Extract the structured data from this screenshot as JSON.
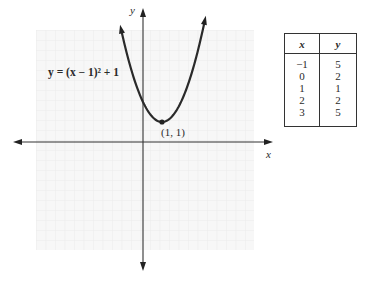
{
  "chart_data": {
    "type": "line",
    "title": "",
    "function": "y = (x - 1)^2 + 1",
    "equation_label": "y = (x − 1)² + 1",
    "xlabel": "x",
    "ylabel": "y",
    "grid": true,
    "xlim": [
      -5.6,
      6.4
    ],
    "ylim": [
      -6.3,
      6.9
    ],
    "vertex": {
      "x": 1,
      "y": 1,
      "label": "(1, 1)"
    },
    "series": [
      {
        "name": "y = (x − 1)² + 1",
        "x": [
          -1.15,
          -1,
          0,
          1,
          2,
          3,
          3.25
        ],
        "y": [
          5.62,
          5,
          2,
          1,
          2,
          5,
          6.06
        ]
      }
    ],
    "table": {
      "columns": [
        "x",
        "y"
      ],
      "rows": [
        [
          -1,
          5
        ],
        [
          0,
          2
        ],
        [
          1,
          1
        ],
        [
          2,
          2
        ],
        [
          3,
          5
        ]
      ]
    }
  },
  "labels": {
    "equation": "y = (x − 1)² + 1",
    "vertex": "(1, 1)",
    "x_axis": "x",
    "y_axis": "y"
  },
  "table": {
    "header": {
      "x": "x",
      "y": "y"
    },
    "x_values": [
      "−1",
      "0",
      "1",
      "2",
      "3"
    ],
    "y_values": [
      "5",
      "2",
      "1",
      "2",
      "5"
    ]
  },
  "colors": {
    "curve": "#2a2a2a",
    "axis": "#333333",
    "grid": "#ededed",
    "grid_bg": "#f7f7f7"
  }
}
